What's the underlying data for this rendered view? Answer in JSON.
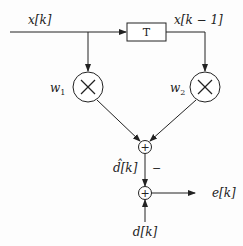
{
  "diagram": {
    "type": "adaptive-filter-block-diagram",
    "labels": {
      "input": "x[k]",
      "delayed_input": "x[k − 1]",
      "delay_block": "T",
      "weight1": "w",
      "weight1_sub": "1",
      "weight2": "w",
      "weight2_sub": "2",
      "estimate": "d̂[k]",
      "minus_sign": "−",
      "error": "e[k]",
      "desired": "d[k]",
      "multiply_symbol": "×",
      "sum_symbol": "+"
    },
    "colors": {
      "stroke": "#222222",
      "background": "#fdfdfd"
    },
    "nodes": [
      {
        "id": "input",
        "label": "x[k]"
      },
      {
        "id": "delay",
        "label": "T"
      },
      {
        "id": "mult1",
        "label": "w1"
      },
      {
        "id": "mult2",
        "label": "w2"
      },
      {
        "id": "sum1",
        "label": "+"
      },
      {
        "id": "sum2",
        "label": "+"
      },
      {
        "id": "error",
        "label": "e[k]"
      },
      {
        "id": "desired",
        "label": "d[k]"
      }
    ],
    "edges": [
      {
        "from": "input",
        "to": "delay"
      },
      {
        "from": "input",
        "to": "mult1"
      },
      {
        "from": "delay",
        "to": "mult2",
        "label": "x[k − 1]"
      },
      {
        "from": "mult1",
        "to": "sum1"
      },
      {
        "from": "mult2",
        "to": "sum1"
      },
      {
        "from": "sum1",
        "to": "sum2",
        "label": "d̂[k]",
        "sign": "−"
      },
      {
        "from": "desired",
        "to": "sum2",
        "label": "d[k]"
      },
      {
        "from": "sum2",
        "to": "error",
        "label": "e[k]"
      }
    ]
  }
}
